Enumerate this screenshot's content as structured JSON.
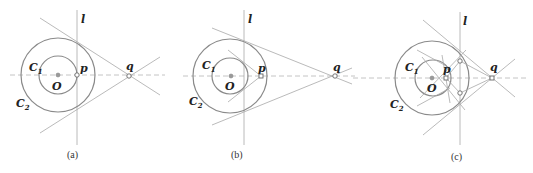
{
  "labels": {
    "line": "l",
    "circle_inner": "C",
    "circle_inner_sub": "1",
    "circle_outer": "C",
    "circle_outer_sub": "2",
    "center": "O",
    "point_p": "p",
    "point_q": "q"
  },
  "panels": [
    {
      "id": "a",
      "caption": "(a)"
    },
    {
      "id": "b",
      "caption": "(b)"
    },
    {
      "id": "c",
      "caption": "(c)"
    }
  ],
  "colors": {
    "circle": "#8a8a8a",
    "line": "#a8a8a8",
    "axis_dashed": "#b5b5b5"
  }
}
